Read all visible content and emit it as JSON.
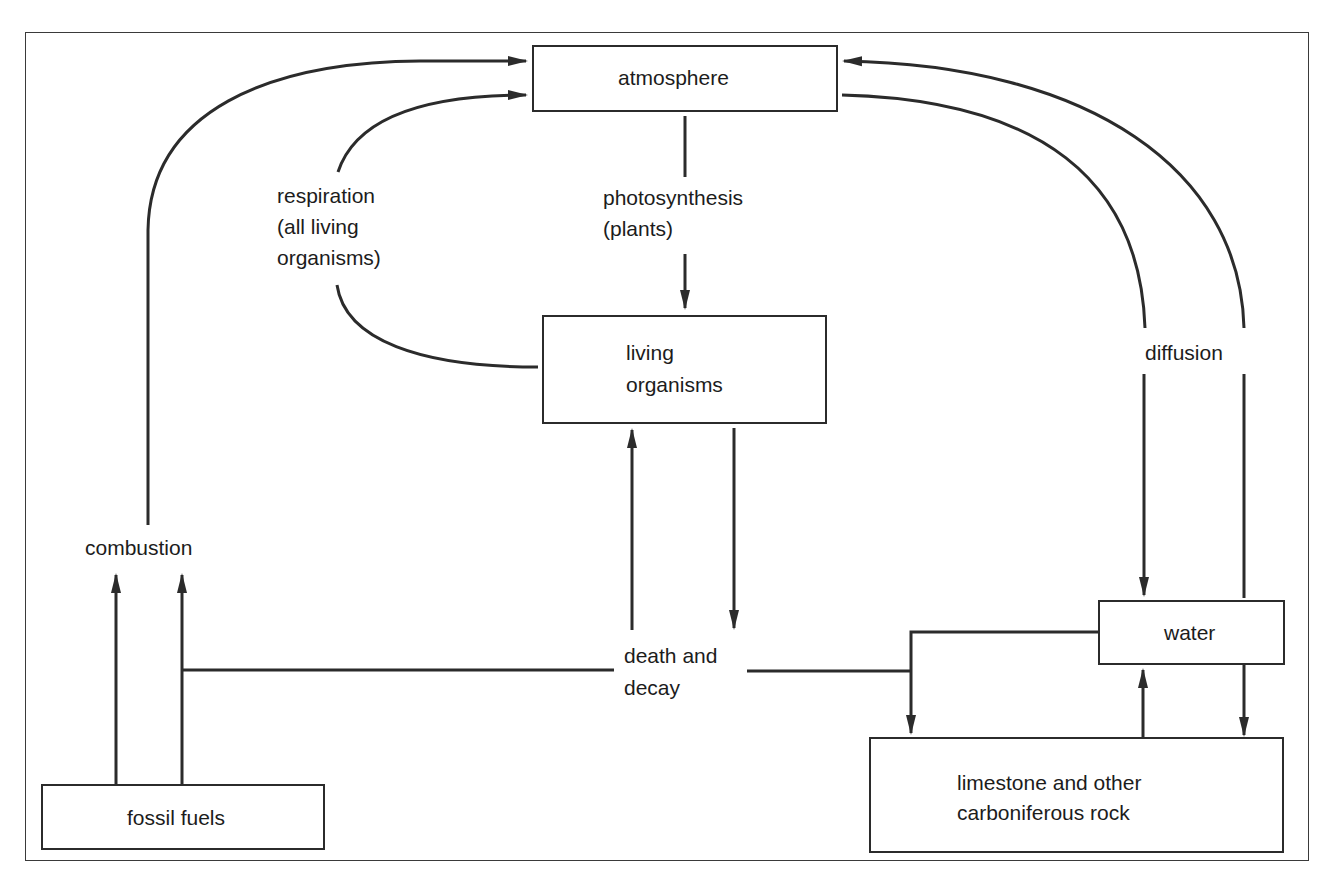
{
  "diagram": {
    "type": "flow",
    "nodes": {
      "atmosphere": {
        "label": "atmosphere"
      },
      "living_organisms": {
        "line1": "living",
        "line2": "organisms"
      },
      "water": {
        "label": "water"
      },
      "rock": {
        "line1": "limestone and other",
        "line2": "carboniferous rock"
      },
      "fossil_fuels": {
        "label": "fossil fuels"
      }
    },
    "process_labels": {
      "respiration": {
        "line1": "respiration",
        "line2": "(all living",
        "line3": "organisms)"
      },
      "photosynthesis": {
        "line1": "photosynthesis",
        "line2": "(plants)"
      },
      "diffusion": {
        "label": "diffusion"
      },
      "combustion": {
        "label": "combustion"
      },
      "death_decay": {
        "line1": "death and",
        "line2": "decay"
      }
    },
    "edges": [
      {
        "from": "fossil_fuels",
        "to": "atmosphere",
        "via": "combustion"
      },
      {
        "from": "living_organisms",
        "to": "atmosphere",
        "via": "respiration"
      },
      {
        "from": "atmosphere",
        "to": "living_organisms",
        "via": "photosynthesis"
      },
      {
        "from": "atmosphere",
        "to": "water",
        "via": "diffusion"
      },
      {
        "from": "water",
        "to": "atmosphere",
        "via": "diffusion"
      },
      {
        "from": "living_organisms",
        "to": "death_decay",
        "via": "death and decay"
      },
      {
        "from": "death_decay",
        "to": "living_organisms",
        "via": "death and decay"
      },
      {
        "from": "death_decay",
        "to": "fossil_fuels",
        "via": "death and decay"
      },
      {
        "from": "death_decay",
        "to": "rock",
        "via": "death and decay"
      },
      {
        "from": "water",
        "to": "rock",
        "via": ""
      },
      {
        "from": "rock",
        "to": "water",
        "via": ""
      }
    ],
    "colors": {
      "line": "#2b2b2b",
      "background": "#ffffff",
      "text": "#1c1c1c"
    }
  }
}
